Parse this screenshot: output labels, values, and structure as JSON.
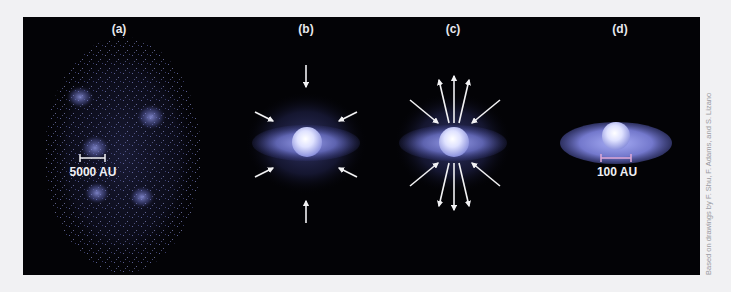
{
  "figure": {
    "panels": [
      {
        "id": "a",
        "label": "(a)",
        "scale_bar": "5000 AU",
        "description": "Dense cloud core fragments into clumps"
      },
      {
        "id": "b",
        "label": "(b)",
        "description": "Collapse with infall arrows, protostar and disk form"
      },
      {
        "id": "c",
        "label": "(c)",
        "description": "Infall continues along with bipolar outflow"
      },
      {
        "id": "d",
        "label": "(d)",
        "scale_bar": "100 AU",
        "description": "Star with circumstellar disk remains"
      }
    ],
    "credit": "Based on drawings by F. Shu, F. Adams, and S. Lizano"
  },
  "colors": {
    "page_background": "#f1f1f3",
    "frame_background": "#030306",
    "disk": "#6f74c8",
    "star": "#e6e8ff",
    "arrow": "#f2f2f4",
    "scale_bar_a": "#f0f0f4",
    "scale_bar_d": "#d9a6d6"
  }
}
